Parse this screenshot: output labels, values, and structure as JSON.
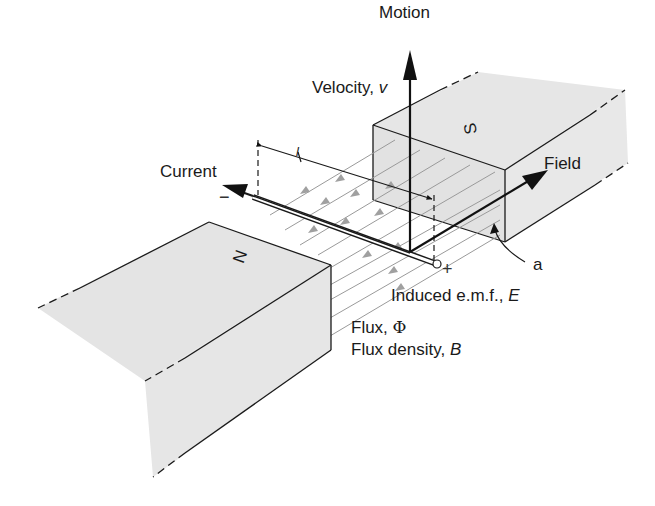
{
  "diagram": {
    "labels": {
      "motion": "Motion",
      "velocity_prefix": "Velocity, ",
      "velocity_symbol": "v",
      "current": "Current",
      "field": "Field",
      "area_marker": "a",
      "emf_prefix": "Induced e.m.f., ",
      "emf_symbol": "E",
      "flux_prefix": "Flux, ",
      "flux_symbol": "Φ",
      "flux_density_prefix": "Flux density, ",
      "flux_density_symbol": "B",
      "length_symbol": "l",
      "minus_sign": "−",
      "plus_sign": "+"
    },
    "magnets": [
      {
        "pole": "N",
        "position": "front-left"
      },
      {
        "pole": "S",
        "position": "back-right"
      }
    ],
    "colors": {
      "magnet_fill": "#e4e4e4",
      "outline": "#1a1a1a",
      "flux_line": "#9a9a9a",
      "flux_arrow": "#a0a0a0",
      "background": "#ffffff"
    },
    "flux_line_count": 9
  }
}
